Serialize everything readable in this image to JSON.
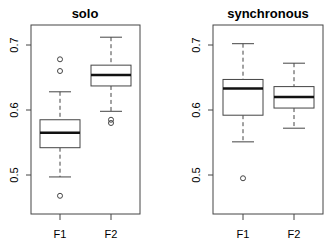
{
  "chart_data": [
    {
      "type": "box",
      "title": "solo",
      "xlabel": "",
      "ylabel": "",
      "categories": [
        "F1",
        "F2"
      ],
      "yticks": [
        "0.5",
        "0.6",
        "0.7"
      ],
      "ylim": [
        0.44,
        0.73
      ],
      "grid": false,
      "boxes": [
        {
          "name": "F1",
          "whisker_low": 0.497,
          "q1": 0.542,
          "median": 0.565,
          "q3": 0.585,
          "whisker_high": 0.628,
          "outliers": [
            0.678,
            0.66,
            0.468
          ]
        },
        {
          "name": "F2",
          "whisker_low": 0.598,
          "q1": 0.637,
          "median": 0.654,
          "q3": 0.669,
          "whisker_high": 0.712,
          "outliers": [
            0.585,
            0.58
          ]
        }
      ]
    },
    {
      "type": "box",
      "title": "synchronous",
      "xlabel": "",
      "ylabel": "",
      "categories": [
        "F1",
        "F2"
      ],
      "yticks": [
        "0.5",
        "0.6",
        "0.7"
      ],
      "ylim": [
        0.44,
        0.73
      ],
      "grid": false,
      "boxes": [
        {
          "name": "F1",
          "whisker_low": 0.551,
          "q1": 0.592,
          "median": 0.633,
          "q3": 0.647,
          "whisker_high": 0.702,
          "outliers": [
            0.495
          ]
        },
        {
          "name": "F2",
          "whisker_low": 0.572,
          "q1": 0.603,
          "median": 0.62,
          "q3": 0.636,
          "whisker_high": 0.672,
          "outliers": []
        }
      ]
    }
  ],
  "panels": [
    {
      "title": "solo",
      "x_labels": [
        "F1",
        "F2"
      ],
      "y_labels": [
        "0.5",
        "0.6",
        "0.7"
      ]
    },
    {
      "title": "synchronous",
      "x_labels": [
        "F1",
        "F2"
      ],
      "y_labels": [
        "0.5",
        "0.6",
        "0.7"
      ]
    }
  ]
}
